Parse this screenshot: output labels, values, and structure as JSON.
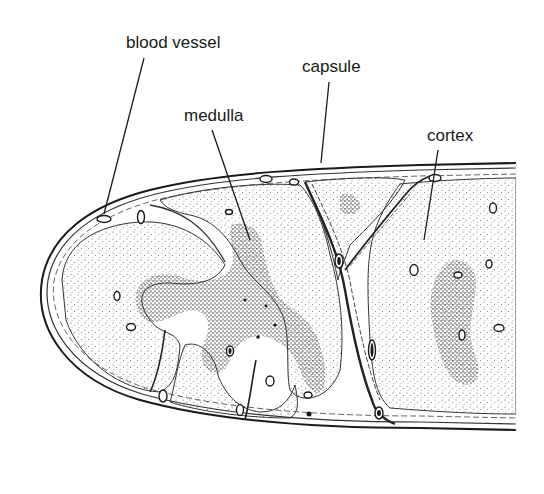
{
  "figure": {
    "type": "histology illustration",
    "colors": {
      "ink": "#1a1a1a",
      "background": "#ffffff",
      "stipple_dark": "#2a2a2a",
      "stipple_light": "#555555"
    }
  },
  "labels": [
    {
      "id": "blood_vessel",
      "text": "blood vessel",
      "x": 126,
      "y": 34,
      "leader": {
        "x1": 144,
        "y1": 58,
        "x2": 104,
        "y2": 214
      }
    },
    {
      "id": "capsule",
      "text": "capsule",
      "x": 302,
      "y": 58,
      "leader": {
        "x1": 329,
        "y1": 82,
        "x2": 321,
        "y2": 163
      }
    },
    {
      "id": "medulla",
      "text": "medulla",
      "x": 184,
      "y": 107,
      "leader": {
        "x1": 212,
        "y1": 130,
        "x2": 250,
        "y2": 240
      }
    },
    {
      "id": "cortex",
      "text": "cortex",
      "x": 427,
      "y": 127,
      "leader": {
        "x1": 438,
        "y1": 150,
        "x2": 424,
        "y2": 240
      }
    }
  ]
}
